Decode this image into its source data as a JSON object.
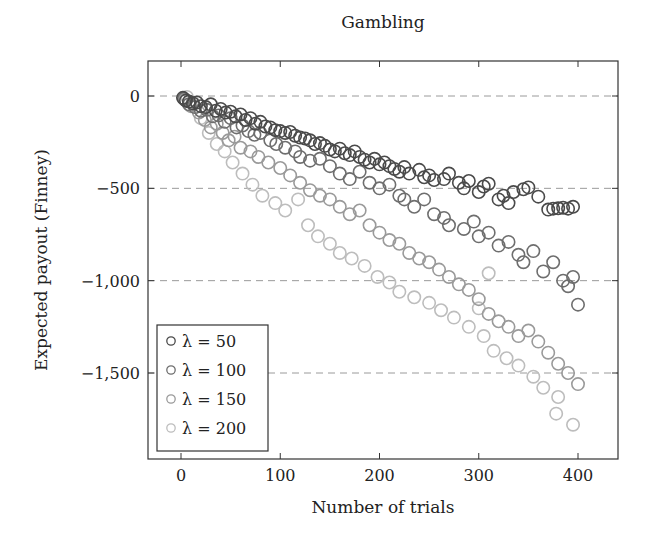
{
  "chart_data": {
    "type": "scatter",
    "title": "Gambling",
    "xlabel": "Number of trials",
    "ylabel": "Expected payout (Finney)",
    "xlim": [
      -33,
      440
    ],
    "ylim": [
      -1950,
      190
    ],
    "xticks": [
      0,
      100,
      200,
      300,
      400
    ],
    "xtick_labels": [
      "0",
      "100",
      "200",
      "300",
      "400"
    ],
    "yticks": [
      0,
      -500,
      -1000,
      -1500
    ],
    "ytick_labels": [
      "0",
      "−500",
      "−1,000",
      "−1,500"
    ],
    "grid": {
      "y_major": true,
      "style": "dashed",
      "x_major": false
    },
    "legend": {
      "position": "lower left",
      "entries": [
        "λ = 50",
        "λ = 100",
        "λ = 150",
        "λ = 200"
      ]
    },
    "series": [
      {
        "name": "λ = 50",
        "color": "#4a4a4a",
        "points": [
          [
            2,
            -10
          ],
          [
            5,
            -25
          ],
          [
            8,
            -30
          ],
          [
            12,
            -40
          ],
          [
            16,
            -35
          ],
          [
            20,
            -55
          ],
          [
            25,
            -60
          ],
          [
            30,
            -45
          ],
          [
            35,
            -80
          ],
          [
            40,
            -70
          ],
          [
            45,
            -90
          ],
          [
            50,
            -85
          ],
          [
            55,
            -110
          ],
          [
            60,
            -100
          ],
          [
            65,
            -130
          ],
          [
            70,
            -120
          ],
          [
            75,
            -150
          ],
          [
            80,
            -140
          ],
          [
            85,
            -165
          ],
          [
            90,
            -170
          ],
          [
            95,
            -185
          ],
          [
            100,
            -190
          ],
          [
            105,
            -200
          ],
          [
            110,
            -195
          ],
          [
            115,
            -215
          ],
          [
            120,
            -225
          ],
          [
            125,
            -230
          ],
          [
            130,
            -240
          ],
          [
            135,
            -260
          ],
          [
            140,
            -255
          ],
          [
            145,
            -270
          ],
          [
            150,
            -290
          ],
          [
            155,
            -300
          ],
          [
            160,
            -285
          ],
          [
            165,
            -310
          ],
          [
            170,
            -320
          ],
          [
            175,
            -300
          ],
          [
            180,
            -330
          ],
          [
            185,
            -345
          ],
          [
            190,
            -360
          ],
          [
            195,
            -340
          ],
          [
            200,
            -370
          ],
          [
            205,
            -360
          ],
          [
            210,
            -380
          ],
          [
            215,
            -395
          ],
          [
            220,
            -410
          ],
          [
            225,
            -385
          ],
          [
            230,
            -420
          ],
          [
            240,
            -400
          ],
          [
            245,
            -440
          ],
          [
            250,
            -430
          ],
          [
            255,
            -455
          ],
          [
            265,
            -450
          ],
          [
            270,
            -420
          ],
          [
            280,
            -470
          ],
          [
            285,
            -500
          ],
          [
            290,
            -460
          ],
          [
            300,
            -520
          ],
          [
            305,
            -490
          ],
          [
            310,
            -475
          ],
          [
            320,
            -560
          ],
          [
            325,
            -540
          ],
          [
            330,
            -580
          ],
          [
            335,
            -520
          ],
          [
            345,
            -505
          ],
          [
            350,
            -495
          ],
          [
            360,
            -545
          ],
          [
            370,
            -615
          ],
          [
            375,
            -610
          ],
          [
            380,
            -608
          ],
          [
            385,
            -605
          ],
          [
            390,
            -610
          ],
          [
            395,
            -600
          ]
        ]
      },
      {
        "name": "λ = 100",
        "color": "#6e6e6e",
        "points": [
          [
            3,
            -15
          ],
          [
            8,
            -45
          ],
          [
            14,
            -60
          ],
          [
            20,
            -80
          ],
          [
            26,
            -75
          ],
          [
            32,
            -110
          ],
          [
            38,
            -105
          ],
          [
            44,
            -140
          ],
          [
            50,
            -120
          ],
          [
            56,
            -170
          ],
          [
            62,
            -160
          ],
          [
            68,
            -190
          ],
          [
            74,
            -210
          ],
          [
            80,
            -200
          ],
          [
            90,
            -240
          ],
          [
            96,
            -260
          ],
          [
            105,
            -280
          ],
          [
            115,
            -300
          ],
          [
            120,
            -330
          ],
          [
            130,
            -350
          ],
          [
            140,
            -340
          ],
          [
            150,
            -380
          ],
          [
            160,
            -420
          ],
          [
            170,
            -450
          ],
          [
            180,
            -410
          ],
          [
            190,
            -470
          ],
          [
            200,
            -500
          ],
          [
            210,
            -480
          ],
          [
            220,
            -540
          ],
          [
            225,
            -560
          ],
          [
            235,
            -600
          ],
          [
            245,
            -560
          ],
          [
            255,
            -640
          ],
          [
            265,
            -660
          ],
          [
            270,
            -700
          ],
          [
            285,
            -720
          ],
          [
            295,
            -680
          ],
          [
            300,
            -760
          ],
          [
            310,
            -740
          ],
          [
            320,
            -810
          ],
          [
            330,
            -790
          ],
          [
            340,
            -860
          ],
          [
            345,
            -900
          ],
          [
            355,
            -840
          ],
          [
            365,
            -950
          ],
          [
            375,
            -900
          ],
          [
            385,
            -1000
          ],
          [
            390,
            -1030
          ],
          [
            395,
            -980
          ],
          [
            400,
            -1130
          ]
        ]
      },
      {
        "name": "λ = 150",
        "color": "#9a9a9a",
        "points": [
          [
            4,
            -20
          ],
          [
            10,
            -55
          ],
          [
            18,
            -90
          ],
          [
            24,
            -130
          ],
          [
            30,
            -170
          ],
          [
            36,
            -150
          ],
          [
            42,
            -200
          ],
          [
            48,
            -240
          ],
          [
            54,
            -220
          ],
          [
            60,
            -280
          ],
          [
            70,
            -300
          ],
          [
            78,
            -330
          ],
          [
            88,
            -360
          ],
          [
            100,
            -390
          ],
          [
            110,
            -430
          ],
          [
            120,
            -470
          ],
          [
            130,
            -510
          ],
          [
            140,
            -540
          ],
          [
            150,
            -560
          ],
          [
            160,
            -600
          ],
          [
            170,
            -640
          ],
          [
            180,
            -620
          ],
          [
            190,
            -700
          ],
          [
            200,
            -740
          ],
          [
            210,
            -780
          ],
          [
            220,
            -800
          ],
          [
            230,
            -850
          ],
          [
            240,
            -880
          ],
          [
            250,
            -900
          ],
          [
            260,
            -940
          ],
          [
            270,
            -980
          ],
          [
            280,
            -1020
          ],
          [
            290,
            -1050
          ],
          [
            300,
            -1100
          ],
          [
            310,
            -1180
          ],
          [
            320,
            -1220
          ],
          [
            330,
            -1250
          ],
          [
            340,
            -1300
          ],
          [
            350,
            -1270
          ],
          [
            360,
            -1330
          ],
          [
            370,
            -1390
          ],
          [
            380,
            -1450
          ],
          [
            390,
            -1500
          ],
          [
            400,
            -1560
          ]
        ]
      },
      {
        "name": "λ = 200",
        "color": "#bdbdbd",
        "points": [
          [
            6,
            -5
          ],
          [
            12,
            -35
          ],
          [
            20,
            -120
          ],
          [
            28,
            -200
          ],
          [
            36,
            -260
          ],
          [
            44,
            -300
          ],
          [
            52,
            -360
          ],
          [
            62,
            -420
          ],
          [
            72,
            -480
          ],
          [
            82,
            -540
          ],
          [
            95,
            -580
          ],
          [
            105,
            -620
          ],
          [
            118,
            -560
          ],
          [
            128,
            -700
          ],
          [
            138,
            -760
          ],
          [
            150,
            -800
          ],
          [
            160,
            -850
          ],
          [
            172,
            -880
          ],
          [
            185,
            -920
          ],
          [
            198,
            -980
          ],
          [
            210,
            -1010
          ],
          [
            220,
            -1060
          ],
          [
            235,
            -1090
          ],
          [
            250,
            -1120
          ],
          [
            262,
            -1160
          ],
          [
            275,
            -1200
          ],
          [
            290,
            -1250
          ],
          [
            305,
            -1300
          ],
          [
            315,
            -1380
          ],
          [
            328,
            -1420
          ],
          [
            340,
            -1460
          ],
          [
            355,
            -1520
          ],
          [
            365,
            -1580
          ],
          [
            380,
            -1630
          ],
          [
            395,
            -1780
          ],
          [
            378,
            -1720
          ],
          [
            300,
            -1150
          ],
          [
            310,
            -960
          ]
        ]
      }
    ]
  }
}
